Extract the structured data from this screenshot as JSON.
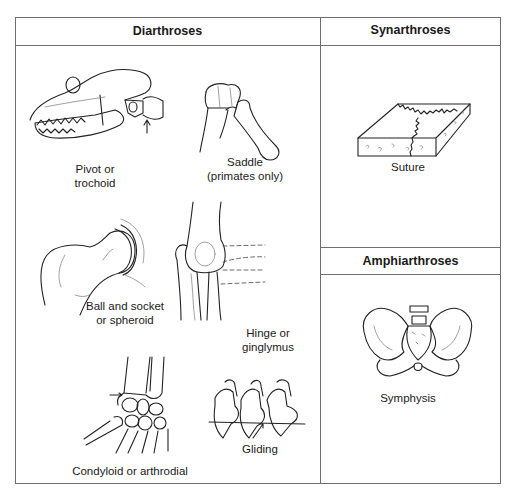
{
  "table": {
    "columns": [
      {
        "id": "diarthroses",
        "header": "Diarthroses"
      },
      {
        "id": "synarthroses",
        "header": "Synarthroses"
      },
      {
        "id": "amphiarthroses",
        "header": "Amphiarthroses"
      }
    ]
  },
  "diarthroses": {
    "header": "Diarthroses",
    "items": [
      {
        "type": "pivot",
        "label_line1": "Pivot or",
        "label_line2": "trochoid",
        "illustration": "dog-skull-atlas-axis"
      },
      {
        "type": "saddle",
        "label_line1": "Saddle",
        "label_line2": "(primates only)",
        "illustration": "thumb-carpometacarpal"
      },
      {
        "type": "ball-and-socket",
        "label_line1": "Ball and socket",
        "label_line2": "or spheroid",
        "illustration": "femur-head-hip"
      },
      {
        "type": "hinge",
        "label_line1": "Hinge or",
        "label_line2": "ginglymus",
        "illustration": "elbow"
      },
      {
        "type": "condyloid",
        "label_line1": "Condyloid or arthrodial",
        "illustration": "wrist-carpals"
      },
      {
        "type": "gliding",
        "label_line1": "Gliding",
        "illustration": "vertebral-articular-processes"
      }
    ]
  },
  "synarthroses": {
    "header": "Synarthroses",
    "items": [
      {
        "type": "suture",
        "label_line1": "Suture",
        "illustration": "skull-bone-block"
      }
    ]
  },
  "amphiarthroses": {
    "header": "Amphiarthroses",
    "items": [
      {
        "type": "symphysis",
        "label_line1": "Symphysis",
        "illustration": "pelvis"
      }
    ]
  }
}
